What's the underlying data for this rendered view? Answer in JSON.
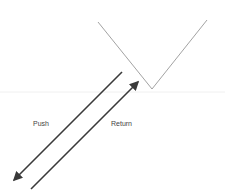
{
  "diagram": {
    "labels": {
      "push": "Push",
      "return": "Return"
    },
    "colors": {
      "background": "#ffffff",
      "v_shape": "#8a8a8a",
      "arrows": "#3a3a3a",
      "text": "#444444",
      "baseline": "#f0f0f0"
    }
  }
}
